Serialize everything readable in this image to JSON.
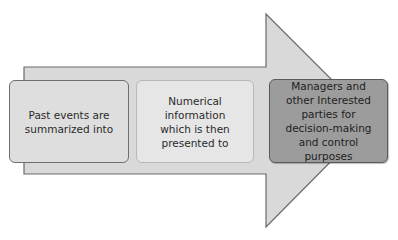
{
  "diagram": {
    "type": "process-arrow",
    "direction": "left-to-right",
    "colors": {
      "arrow_fill": "#d9d9d9",
      "arrow_stroke": "#6a6a6a",
      "box1_fill": "#dedede",
      "box2_fill": "#e6e6e6",
      "box3_fill": "#9c9c9c"
    },
    "steps": [
      {
        "label": "Past events are\nsummarized into"
      },
      {
        "label": "Numerical\ninformation\nwhich is then\npresented to"
      },
      {
        "label": "Managers and\nother Interested\nparties for\ndecision-making\nand control purposes"
      }
    ]
  }
}
